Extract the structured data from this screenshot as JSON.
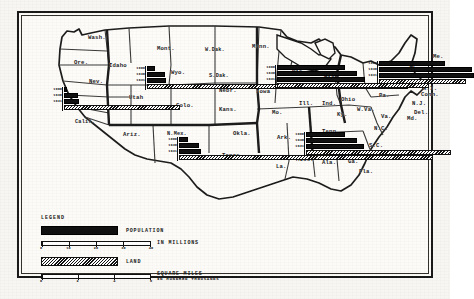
{
  "figure": {
    "type": "thematic-map"
  },
  "legend": {
    "title": "LEGEND",
    "population": {
      "label": "POPULATION",
      "sublabel": "IN MILLIONS",
      "scale_ticks": [
        "0",
        "10",
        "20",
        "30",
        "40"
      ],
      "scale_max": 40
    },
    "land": {
      "label": "LAND",
      "sublabel_line1": "SQUARE MILES",
      "sublabel_line2": "IN HUNDRED THOUSANDS",
      "scale_ticks": [
        "0",
        "2",
        "4",
        "6"
      ],
      "scale_max": 6
    }
  },
  "years": [
    "1900",
    "1930",
    "1931"
  ],
  "state_labels": [
    {
      "name": "Wash.",
      "x": 69,
      "y": 21
    },
    {
      "name": "Ore.",
      "x": 55,
      "y": 46
    },
    {
      "name": "Idaho",
      "x": 90,
      "y": 49
    },
    {
      "name": "Mont.",
      "x": 138,
      "y": 32
    },
    {
      "name": "W.Dak.",
      "x": 186,
      "y": 34
    },
    {
      "name": "Minn.",
      "x": 233,
      "y": 30
    },
    {
      "name": "Wyo.",
      "x": 152,
      "y": 56
    },
    {
      "name": "S.Dak.",
      "x": 190,
      "y": 60
    },
    {
      "name": "Nev.",
      "x": 70,
      "y": 65
    },
    {
      "name": "Utah",
      "x": 110,
      "y": 81
    },
    {
      "name": "Colo.",
      "x": 157,
      "y": 89
    },
    {
      "name": "Nebr.",
      "x": 200,
      "y": 74
    },
    {
      "name": "Kans.",
      "x": 200,
      "y": 93
    },
    {
      "name": "Iowa",
      "x": 237,
      "y": 75
    },
    {
      "name": "Mo.",
      "x": 253,
      "y": 96
    },
    {
      "name": "Wis.",
      "x": 273,
      "y": 55
    },
    {
      "name": "Mich.",
      "x": 305,
      "y": 61
    },
    {
      "name": "Ill.",
      "x": 280,
      "y": 87
    },
    {
      "name": "Ind.",
      "x": 303,
      "y": 87
    },
    {
      "name": "Ohio",
      "x": 322,
      "y": 83
    },
    {
      "name": "Ky.",
      "x": 318,
      "y": 98
    },
    {
      "name": "Pa.",
      "x": 360,
      "y": 79
    },
    {
      "name": "N.Y.",
      "x": 352,
      "y": 69
    },
    {
      "name": "Vt.",
      "x": 390,
      "y": 50
    },
    {
      "name": "Me.",
      "x": 414,
      "y": 40
    },
    {
      "name": "R.I.",
      "x": 404,
      "y": 72
    },
    {
      "name": "Conn.",
      "x": 402,
      "y": 78
    },
    {
      "name": "N.J.",
      "x": 393,
      "y": 87
    },
    {
      "name": "Del.",
      "x": 395,
      "y": 96
    },
    {
      "name": "Md.",
      "x": 388,
      "y": 102
    },
    {
      "name": "W.Va.",
      "x": 338,
      "y": 93
    },
    {
      "name": "Va.",
      "x": 362,
      "y": 100
    },
    {
      "name": "N.C.",
      "x": 355,
      "y": 112
    },
    {
      "name": "S.C.",
      "x": 350,
      "y": 129
    },
    {
      "name": "Tenn.",
      "x": 303,
      "y": 115
    },
    {
      "name": "Ark.",
      "x": 258,
      "y": 121
    },
    {
      "name": "Miss.",
      "x": 277,
      "y": 143
    },
    {
      "name": "Ala.",
      "x": 303,
      "y": 146
    },
    {
      "name": "Ga.",
      "x": 329,
      "y": 145
    },
    {
      "name": "La.",
      "x": 257,
      "y": 150
    },
    {
      "name": "Fla.",
      "x": 340,
      "y": 155
    },
    {
      "name": "Texas",
      "x": 203,
      "y": 139
    },
    {
      "name": "Okla.",
      "x": 214,
      "y": 117
    },
    {
      "name": "N.Mex.",
      "x": 148,
      "y": 118
    },
    {
      "name": "Ariz.",
      "x": 104,
      "y": 118
    },
    {
      "name": "Calif.",
      "x": 56,
      "y": 106
    }
  ],
  "chart_data": {
    "type": "bar",
    "units": {
      "population": "millions",
      "land": "hundred thousand square miles"
    },
    "categories": [
      "1900",
      "1930",
      "1931"
    ],
    "clusters": [
      {
        "name": "pacific-southwest",
        "anchor_state": "Calif.",
        "x": 30,
        "y": 74,
        "population": [
          1.5,
          6.0,
          6.2
        ],
        "land": 16.0
      },
      {
        "name": "mountain-plains",
        "anchor_state": "Wyo.",
        "x": 113,
        "y": 53,
        "population": [
          3.5,
          7.5,
          8.0
        ],
        "land": 36.0
      },
      {
        "name": "midwest-northeast",
        "anchor_state": "Wis.",
        "x": 243,
        "y": 52,
        "population": [
          28.0,
          33.0,
          36.0
        ],
        "land": 21.0
      },
      {
        "name": "mid-atlantic-newengland",
        "anchor_state": "N.Y.",
        "x": 345,
        "y": 48,
        "population": [
          27.0,
          38.0,
          39.0
        ],
        "land": 12.0
      },
      {
        "name": "southeast",
        "anchor_state": "Tenn.",
        "x": 272,
        "y": 119,
        "population": [
          16.0,
          21.0,
          24.0
        ],
        "land": 20.0
      },
      {
        "name": "southwest-texas",
        "anchor_state": "N.Mex.",
        "x": 145,
        "y": 124,
        "population": [
          4.0,
          8.5,
          9.0
        ],
        "land": 35.0
      }
    ]
  }
}
